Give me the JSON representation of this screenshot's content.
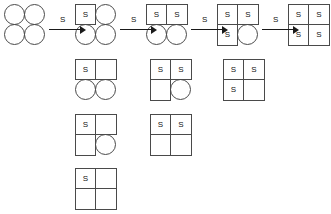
{
  "diagram": {
    "cell_label": "S",
    "arrow_label": "S",
    "legend": {
      "square_meaning": "occupied site labeled S",
      "circle_meaning": "vacant site",
      "blank_meaning": "empty square cell"
    },
    "main_chain": {
      "name": "main-reaction-chain",
      "clusters": [
        {
          "id": "state-0",
          "x": 4,
          "y": 4,
          "cells": [
            {
              "shape": "circle",
              "label": ""
            },
            {
              "shape": "circle",
              "label": ""
            },
            {
              "shape": "circle",
              "label": ""
            },
            {
              "shape": "circle",
              "label": ""
            }
          ]
        },
        {
          "id": "state-1",
          "x": 75,
          "y": 4,
          "cells": [
            {
              "shape": "square",
              "label": "S"
            },
            {
              "shape": "circle",
              "label": ""
            },
            {
              "shape": "circle",
              "label": ""
            },
            {
              "shape": "circle",
              "label": ""
            }
          ]
        },
        {
          "id": "state-2",
          "x": 146,
          "y": 4,
          "cells": [
            {
              "shape": "square",
              "label": "S"
            },
            {
              "shape": "square",
              "label": "S"
            },
            {
              "shape": "circle",
              "label": ""
            },
            {
              "shape": "circle",
              "label": ""
            }
          ]
        },
        {
          "id": "state-3",
          "x": 217,
          "y": 4,
          "cells": [
            {
              "shape": "square",
              "label": "S"
            },
            {
              "shape": "square",
              "label": "S"
            },
            {
              "shape": "square",
              "label": "S"
            },
            {
              "shape": "circle",
              "label": ""
            }
          ]
        },
        {
          "id": "state-4",
          "x": 288,
          "y": 4,
          "cells": [
            {
              "shape": "square",
              "label": "S"
            },
            {
              "shape": "square",
              "label": "S"
            },
            {
              "shape": "square",
              "label": "S"
            },
            {
              "shape": "square",
              "label": "S"
            }
          ]
        }
      ],
      "arrows": [
        {
          "id": "arrow-0-1",
          "x": 49,
          "y": 16,
          "label": "S"
        },
        {
          "id": "arrow-1-2",
          "x": 120,
          "y": 16,
          "label": "S"
        },
        {
          "id": "arrow-2-3",
          "x": 191,
          "y": 16,
          "label": "S"
        },
        {
          "id": "arrow-3-4",
          "x": 262,
          "y": 16,
          "label": "S"
        }
      ]
    },
    "alternate_states": {
      "name": "alternate-state-grid",
      "clusters": [
        {
          "id": "alt-row1-col1",
          "x": 75,
          "y": 59,
          "cells": [
            {
              "shape": "square",
              "label": "S"
            },
            {
              "shape": "square",
              "label": ""
            },
            {
              "shape": "circle",
              "label": ""
            },
            {
              "shape": "circle",
              "label": ""
            }
          ]
        },
        {
          "id": "alt-row1-col2",
          "x": 150,
          "y": 59,
          "cells": [
            {
              "shape": "square",
              "label": "S"
            },
            {
              "shape": "square",
              "label": "S"
            },
            {
              "shape": "square",
              "label": ""
            },
            {
              "shape": "circle",
              "label": ""
            }
          ]
        },
        {
          "id": "alt-row1-col3",
          "x": 223,
          "y": 59,
          "cells": [
            {
              "shape": "square",
              "label": "S"
            },
            {
              "shape": "square",
              "label": "S"
            },
            {
              "shape": "square",
              "label": "S"
            },
            {
              "shape": "square",
              "label": ""
            }
          ]
        },
        {
          "id": "alt-row2-col1",
          "x": 75,
          "y": 114,
          "cells": [
            {
              "shape": "square",
              "label": "S"
            },
            {
              "shape": "square",
              "label": ""
            },
            {
              "shape": "square",
              "label": ""
            },
            {
              "shape": "circle",
              "label": ""
            }
          ]
        },
        {
          "id": "alt-row2-col2",
          "x": 150,
          "y": 114,
          "cells": [
            {
              "shape": "square",
              "label": "S"
            },
            {
              "shape": "square",
              "label": "S"
            },
            {
              "shape": "square",
              "label": ""
            },
            {
              "shape": "square",
              "label": ""
            }
          ]
        },
        {
          "id": "alt-row3-col1",
          "x": 75,
          "y": 168,
          "cells": [
            {
              "shape": "square",
              "label": "S"
            },
            {
              "shape": "square",
              "label": ""
            },
            {
              "shape": "square",
              "label": ""
            },
            {
              "shape": "square",
              "label": ""
            }
          ]
        }
      ]
    }
  }
}
